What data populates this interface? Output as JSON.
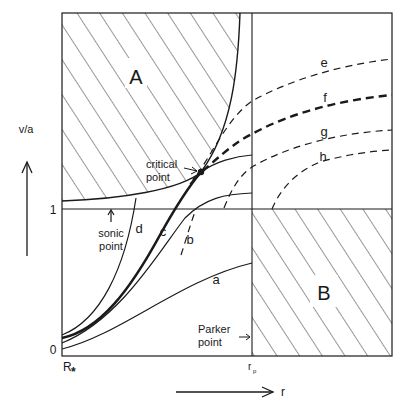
{
  "diagram": {
    "y_axis_label": "v/a",
    "x_axis_label": "r",
    "y_ticks": [
      "0",
      "1"
    ],
    "x_ticks": [
      "R*",
      "rp"
    ],
    "x_tick_r_star_main": "R",
    "x_tick_r_star_sub": "*",
    "x_tick_rp_main": "r",
    "x_tick_rp_sub": "p",
    "regions": [
      {
        "id": "A",
        "label": "A"
      },
      {
        "id": "B",
        "label": "B"
      }
    ],
    "annotations": {
      "critical_point_line1": "critical",
      "critical_point_line2": "point",
      "sonic_point_line1": "sonic",
      "sonic_point_line2": "point",
      "parker_point_line1": "Parker",
      "parker_point_line2": "point"
    },
    "curves": [
      {
        "id": "a",
        "label": "a",
        "style": "solid"
      },
      {
        "id": "b",
        "label": "b",
        "style": "solid"
      },
      {
        "id": "c",
        "label": "c",
        "style": "solid-bold"
      },
      {
        "id": "d",
        "label": "d",
        "style": "solid"
      },
      {
        "id": "e",
        "label": "e",
        "style": "dashed"
      },
      {
        "id": "f",
        "label": "f",
        "style": "dashed-bold"
      },
      {
        "id": "g",
        "label": "g",
        "style": "dashed"
      },
      {
        "id": "h",
        "label": "h",
        "style": "dashed"
      }
    ],
    "colors": {
      "ink": "#1a1a1a",
      "background": "#ffffff"
    }
  }
}
